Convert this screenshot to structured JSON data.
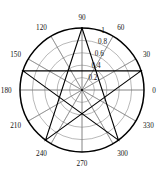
{
  "figure": {
    "kind": "polar-plot",
    "background_color": "#ffffff",
    "grid_color": "#7d7d7d",
    "axis_color": "#000000",
    "series_color": "#000000",
    "center_x": 82,
    "center_y": 90,
    "outer_radius": 62
  },
  "chart_data": {
    "type": "line",
    "title": "",
    "xlabel": "",
    "ylabel": "",
    "polar": true,
    "grid": true,
    "legend": null,
    "angle_unit": "degrees",
    "theta_ticks": [
      0,
      30,
      60,
      90,
      120,
      150,
      180,
      210,
      240,
      270,
      300,
      330
    ],
    "theta_tick_labels": [
      "0",
      "30",
      "60",
      "90",
      "120",
      "150",
      "180",
      "210",
      "240",
      "270",
      "300",
      "330"
    ],
    "r_ticks": [
      0.2,
      0.4,
      0.6,
      0.8,
      1
    ],
    "r_tick_labels": [
      "0.2",
      "0.4",
      "0.6",
      "0.8",
      "1"
    ],
    "rlim": [
      0,
      1
    ],
    "r_label_angle": 75,
    "theta_zero_location": "E",
    "theta_direction": "counterclockwise",
    "series": [
      {
        "name": "pentagram",
        "theta": [
          90,
          234,
          18,
          162,
          306,
          90
        ],
        "r": [
          1,
          1,
          1,
          1,
          1,
          1
        ]
      }
    ],
    "vertices": [
      {
        "theta": 90,
        "r": 1
      },
      {
        "theta": 162,
        "r": 1
      },
      {
        "theta": 234,
        "r": 1
      },
      {
        "theta": 306,
        "r": 1
      },
      {
        "theta": 18,
        "r": 1
      }
    ]
  }
}
